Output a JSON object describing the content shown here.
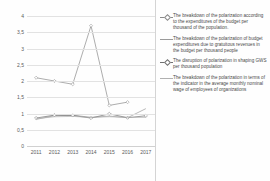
{
  "chart_data": {
    "type": "line",
    "title": "",
    "xlabel": "",
    "ylabel": "",
    "categories": [
      "2011",
      "2012",
      "2013",
      "2014",
      "2015",
      "2016",
      "2017"
    ],
    "ylim": [
      0,
      4
    ],
    "yticks": [
      "0",
      "0,5",
      "1",
      "1,5",
      "2",
      "2,5",
      "3",
      "3,5",
      "4"
    ],
    "ytick_values": [
      0,
      0.5,
      1,
      1.5,
      2,
      2.5,
      3,
      3.5,
      4
    ],
    "grid": true,
    "legend_position": "right",
    "series": [
      {
        "name": "The breakdown of the polarization according to the expenditures of the budget per thousand of the population.",
        "color": "#8a8a8a",
        "marker": "diamond",
        "values": [
          2.1,
          2.0,
          1.9,
          3.7,
          1.25,
          1.35,
          null
        ]
      },
      {
        "name": "The breakdown of the polarization of budget expenditures due to gratuitous revenues in the budget per thousand people",
        "color": "#9a9a9a",
        "marker": "none",
        "values": [
          0.82,
          0.93,
          0.95,
          0.88,
          0.92,
          0.87,
          1.15
        ]
      },
      {
        "name": "The disruption of polarization in shaping GWS per thousand population",
        "color": "#707070",
        "marker": "diamond",
        "values": [
          0.86,
          0.95,
          0.94,
          0.86,
          0.99,
          0.87,
          0.93
        ]
      },
      {
        "name": "The breakdown of the polarization in terms of the indicator in the average monthly nominal wage of employees of organizations",
        "color": "#b0b0b0",
        "marker": "none",
        "values": [
          0.84,
          0.9,
          0.91,
          0.88,
          0.9,
          0.88,
          0.88
        ]
      }
    ]
  }
}
